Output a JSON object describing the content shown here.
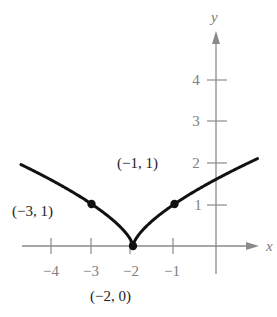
{
  "chart_data": {
    "type": "line",
    "title": "",
    "xlabel": "x",
    "ylabel": "y",
    "xlim": [
      -4.7,
      1
    ],
    "ylim": [
      0,
      4.6
    ],
    "grid": false,
    "x_ticks": [
      -4,
      -3,
      -2,
      -1
    ],
    "x_tick_labels": [
      "−4",
      "−3",
      "−2",
      "−1"
    ],
    "y_ticks": [
      1,
      2,
      3,
      4
    ],
    "y_tick_labels": [
      "1",
      "2",
      "3",
      "4"
    ],
    "function": "y = (x + 2)^(2/3)",
    "series": [
      {
        "name": "curve",
        "x": [
          -4.7,
          -4.5,
          -4,
          -3.5,
          -3,
          -2.5,
          -2.2,
          -2,
          -1.8,
          -1.5,
          -1,
          -0.5,
          0,
          0.5,
          1
        ],
        "values": [
          1.94,
          1.84,
          1.59,
          1.31,
          1,
          0.63,
          0.34,
          0,
          0.34,
          0.63,
          1,
          1.31,
          1.59,
          1.84,
          2.08
        ]
      }
    ],
    "points": [
      {
        "x": -3,
        "y": 1,
        "label": "(−3, 1)"
      },
      {
        "x": -2,
        "y": 0,
        "label": "(−2, 0)"
      },
      {
        "x": -1,
        "y": 1,
        "label": "(−1, 1)"
      }
    ],
    "annotations": [
      "(−3, 1)",
      "(−2, 0)",
      "(−1, 1)"
    ]
  },
  "axes": {
    "x_label": "x",
    "y_label": "y",
    "x_tick_labels": [
      "−4",
      "−3",
      "−2",
      "−1"
    ],
    "y_tick_labels": [
      "1",
      "2",
      "3",
      "4"
    ]
  },
  "points": {
    "p1": "(−3, 1)",
    "p2": "(−2, 0)",
    "p3": "(−1, 1)"
  },
  "colors": {
    "axis": "#808080",
    "curve": "#111111"
  }
}
